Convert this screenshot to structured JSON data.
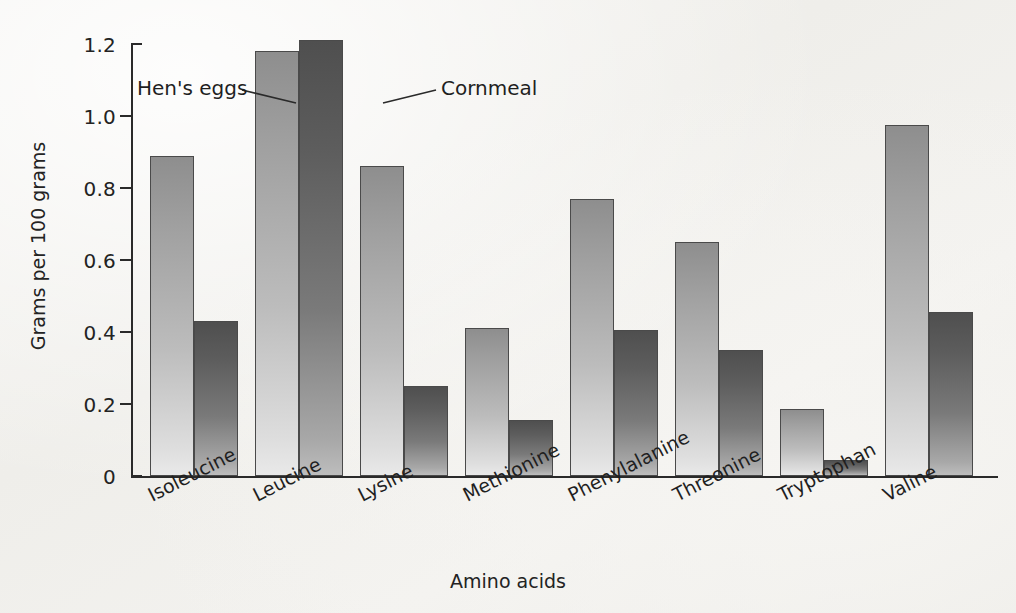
{
  "chart_data": {
    "type": "bar",
    "title": "",
    "xlabel": "Amino acids",
    "ylabel": "Grams per 100 grams",
    "categories": [
      "Isoleucine",
      "Leucine",
      "Lysine",
      "Methionine",
      "Phenylalanine",
      "Threonine",
      "Tryptophan",
      "Valine"
    ],
    "series": [
      {
        "name": "Hen's eggs",
        "color": "#b0b0b0",
        "values": [
          0.89,
          1.18,
          0.86,
          0.41,
          0.77,
          0.65,
          0.185,
          0.975
        ]
      },
      {
        "name": "Cornmeal",
        "color": "#5d5d5d",
        "values": [
          0.43,
          1.21,
          0.25,
          0.155,
          0.405,
          0.35,
          0.045,
          0.455
        ]
      }
    ],
    "ylim": [
      0,
      1.2
    ],
    "ytick_values": [
      1.2,
      1.0,
      0.8,
      0.6,
      0.4,
      0.2,
      0
    ],
    "ytick_labels": [
      "1.2",
      "1.0",
      "0.8",
      "0.6",
      "0.4",
      "0.2",
      "0"
    ],
    "grid": false,
    "legend_position": "inline-annotations",
    "annotations": [
      {
        "id": "hens-eggs",
        "text": "Hen's eggs",
        "points_to": "Leucine light bar"
      },
      {
        "id": "cornmeal",
        "text": "Cornmeal",
        "points_to": "Leucine dark bar"
      }
    ]
  }
}
